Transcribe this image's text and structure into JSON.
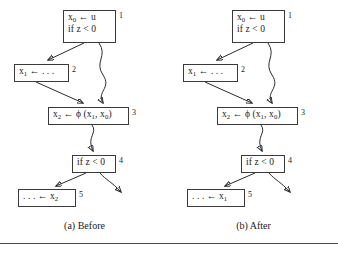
{
  "figure": {
    "caption_before": "(a) Before",
    "caption_after": "(b) After"
  },
  "panels": [
    {
      "id": "before",
      "caption": "(a) Before",
      "nodes": [
        {
          "id": 1,
          "label": "1",
          "lines": [
            "x0 ← u",
            "if z < 0"
          ]
        },
        {
          "id": 2,
          "label": "2",
          "lines": [
            "x1 ← . . ."
          ]
        },
        {
          "id": 3,
          "label": "3",
          "lines": [
            "x2 ← ϕ (x1, x0)"
          ]
        },
        {
          "id": 4,
          "label": "4",
          "lines": [
            "if z < 0"
          ]
        },
        {
          "id": 5,
          "label": "5",
          "lines": [
            ". . . ← x2"
          ]
        }
      ]
    },
    {
      "id": "after",
      "caption": "(b) After",
      "nodes": [
        {
          "id": 1,
          "label": "1",
          "lines": [
            "x0 ← u",
            "if z < 0"
          ]
        },
        {
          "id": 2,
          "label": "2",
          "lines": [
            "x1 ← . . ."
          ]
        },
        {
          "id": 3,
          "label": "3",
          "lines": [
            "x2 ← ϕ (x1, x0)"
          ]
        },
        {
          "id": 4,
          "label": "4",
          "lines": [
            "if z < 0"
          ]
        },
        {
          "id": 5,
          "label": "5",
          "lines": [
            ". . . ← x1"
          ]
        }
      ]
    }
  ],
  "text": {
    "assign_x0": "x",
    "sub0": "0",
    "arrow": "←",
    "u": "u",
    "if_z": "if z < 0",
    "assign_x1": "x",
    "sub1": "1",
    "dots": ". . .",
    "assign_x2": "x",
    "sub2": "2",
    "phi": "ϕ",
    "paren_open": "(x",
    "comma": ", x",
    "paren_close": ")",
    "label1": "1",
    "label2": "2",
    "label3": "3",
    "label4": "4",
    "label5": "5"
  },
  "colors": {
    "background": "#ffffff",
    "ink": "#1a1a1a",
    "stroke": "#2b2b2b",
    "box_border": "#3a3a3a",
    "rule": "#4a4a4a"
  }
}
